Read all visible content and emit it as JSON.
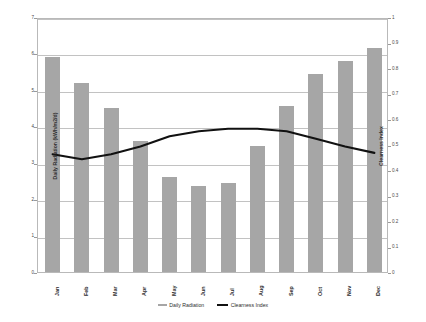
{
  "chart_data": {
    "type": "bar",
    "title": "",
    "xlabel": "",
    "ylabel": "Daily Radiation (kWh/m2/d)",
    "y2label": "Clearness Index",
    "categories": [
      "Jan",
      "Feb",
      "Mar",
      "Apr",
      "May",
      "Jun",
      "Jul",
      "Aug",
      "Sep",
      "Oct",
      "Nov",
      "Dec"
    ],
    "ylim": [
      0,
      7
    ],
    "y2lim": [
      0,
      1
    ],
    "yticks": [
      "0",
      "1",
      "2",
      "3",
      "4",
      "5",
      "6",
      "7"
    ],
    "y2ticks": [
      "0",
      "0.1",
      "0.2",
      "0.3",
      "0.4",
      "0.5",
      "0.6",
      "0.7",
      "0.8",
      "0.9",
      "1"
    ],
    "grid": true,
    "legend_position": "bottom",
    "series": [
      {
        "name": "Daily Radiation",
        "type": "bar",
        "axis": "left",
        "color": "#a6a6a6",
        "values": [
          5.9,
          5.2,
          4.5,
          3.6,
          2.6,
          2.35,
          2.45,
          3.45,
          4.55,
          5.45,
          5.8,
          6.15
        ]
      },
      {
        "name": "Clearness Index",
        "type": "line",
        "axis": "right",
        "color": "#111111",
        "values": [
          0.47,
          0.45,
          0.47,
          0.5,
          0.54,
          0.56,
          0.57,
          0.57,
          0.56,
          0.53,
          0.5,
          0.475
        ]
      }
    ]
  }
}
